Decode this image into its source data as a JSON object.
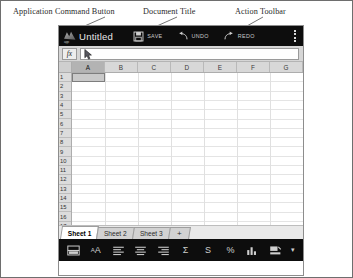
{
  "annotations": [
    {
      "key": "app_command_button",
      "text": "Application Command Button"
    },
    {
      "key": "document_title",
      "text": "Document Title"
    },
    {
      "key": "action_toolbar",
      "text": "Action Toolbar"
    },
    {
      "key": "menu_options",
      "text": "Menu Options"
    },
    {
      "key": "cell_pointer",
      "text": "Cell Pointer"
    },
    {
      "key": "column_letter",
      "text": "Column Letter"
    },
    {
      "key": "formula_bar",
      "text": "Formula Bar"
    },
    {
      "key": "row_number",
      "text": "Row Number"
    },
    {
      "key": "add_worksheet",
      "text": "Add a Worksheet"
    },
    {
      "key": "current_worksheet",
      "text": "Current Worksheet"
    },
    {
      "key": "formatting_bar",
      "text": "Formating Bar"
    }
  ],
  "app": {
    "titlebar": {
      "app_icon": "app-logo-icon",
      "document_title": "Untitled",
      "actions": [
        {
          "icon": "save-floppy-icon",
          "label": "SAVE"
        },
        {
          "icon": "undo-arrow-icon",
          "label": "UNDO"
        },
        {
          "icon": "redo-arrow-icon",
          "label": "REDO"
        }
      ],
      "menu_icon": "kebab-menu-icon"
    },
    "formula_bar": {
      "fx_label": "fx",
      "value": "",
      "placeholder": ""
    },
    "grid": {
      "columns": [
        "A",
        "B",
        "C",
        "D",
        "E",
        "F",
        "G"
      ],
      "selected_column": "A",
      "rows": [
        "1",
        "2",
        "3",
        "4",
        "5",
        "6",
        "7",
        "8",
        "9",
        "10",
        "11",
        "12",
        "13",
        "14",
        "15",
        "16",
        "17"
      ],
      "active_cell": "A1"
    },
    "sheet_tabs": {
      "tabs": [
        {
          "label": "Sheet 1",
          "active": true
        },
        {
          "label": "Sheet 2",
          "active": false
        },
        {
          "label": "Sheet 3",
          "active": false
        }
      ],
      "add_label": "+"
    },
    "formatting_bar": {
      "buttons": [
        {
          "name": "borders-icon",
          "glyph": "border"
        },
        {
          "name": "text-style-icon",
          "glyph": "aa"
        },
        {
          "name": "align-left-icon",
          "glyph": "alignleft"
        },
        {
          "name": "align-center-icon",
          "glyph": "aligncenter"
        },
        {
          "name": "align-right-icon",
          "glyph": "alignright"
        },
        {
          "name": "sum-icon",
          "glyph": "Σ"
        },
        {
          "name": "currency-icon",
          "glyph": "S"
        },
        {
          "name": "percent-icon",
          "glyph": "%"
        },
        {
          "name": "chart-icon",
          "glyph": "chart"
        },
        {
          "name": "fill-color-icon",
          "glyph": "fill"
        },
        {
          "name": "more-options-icon",
          "glyph": "dot"
        }
      ]
    }
  },
  "colors": {
    "chrome_dark": "#0d0d0d",
    "toolbar_text": "#c9c9c9",
    "grid_line": "#e0e0e0",
    "header_gray": "#d8d8d8",
    "selection": "#b3b3b3"
  }
}
